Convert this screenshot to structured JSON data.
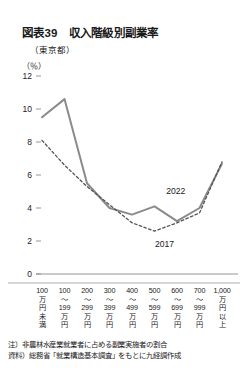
{
  "figure": {
    "title": "図表39　収入階級別副業率",
    "subtitle": "（東京都）",
    "unit": "（％）",
    "note": "注）非農林水産業就業者に占める副業実施者の割合",
    "source": "資料）総務省「就業構造基本調査」をもとに九経調作成"
  },
  "chart_data": {
    "type": "line",
    "title": "収入階級別副業率",
    "subtitle": "（東京都）",
    "xlabel": "",
    "ylabel": "（％）",
    "ylim": [
      0,
      12
    ],
    "yticks": [
      0,
      2,
      4,
      6,
      8,
      10,
      12
    ],
    "ytick_labels": [
      "0",
      "2",
      "4",
      "6",
      "8",
      "10",
      "12"
    ],
    "grid": false,
    "legend_position": "inline-annotation",
    "categories": [
      "100万円未満",
      "100～199万円",
      "200～299万円",
      "300～399万円",
      "400～499万円",
      "500～599万円",
      "600～699万円",
      "700～999万円",
      "1,000万円以上"
    ],
    "category_lines": [
      [
        "100",
        "万",
        "円",
        "未",
        "満"
      ],
      [
        "100",
        "～",
        "199",
        "万",
        "円"
      ],
      [
        "200",
        "～",
        "299",
        "万",
        "円"
      ],
      [
        "300",
        "～",
        "399",
        "万",
        "円"
      ],
      [
        "400",
        "～",
        "499",
        "万",
        "円"
      ],
      [
        "500",
        "～",
        "599",
        "万",
        "円"
      ],
      [
        "600",
        "～",
        "699",
        "万",
        "円"
      ],
      [
        "700",
        "～",
        "999",
        "万",
        "円"
      ],
      [
        "1,000",
        "万",
        "円",
        "以",
        "上"
      ]
    ],
    "series": [
      {
        "name": "2022",
        "style": "solid",
        "color": "#8a8a8a",
        "values": [
          9.5,
          10.6,
          5.5,
          4.0,
          3.6,
          4.1,
          3.2,
          4.0,
          6.7
        ],
        "label_x": 6.05,
        "label_y": 4.95
      },
      {
        "name": "2017",
        "style": "dashed",
        "color": "#555555",
        "values": [
          8.1,
          6.6,
          5.3,
          4.2,
          3.1,
          2.6,
          3.1,
          3.7,
          6.8
        ],
        "label_x": 5.55,
        "label_y": 1.75
      }
    ]
  }
}
